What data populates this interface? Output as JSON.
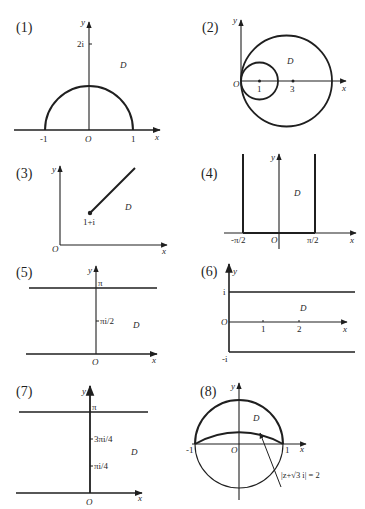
{
  "figure": {
    "ink_color": "#1f1f1f",
    "background": "#ffffff",
    "panels": [
      {
        "id": "1",
        "label": "(1)",
        "axis_x": "x",
        "axis_y": "y",
        "origin": "O",
        "region": "D",
        "ticks": {
          "neg_one": "-1",
          "one": "1",
          "two_i": "2i"
        },
        "description": "Upper half plane outside unit semicircle"
      },
      {
        "id": "2",
        "label": "(2)",
        "axis_x": "x",
        "axis_y": "y",
        "origin": "O",
        "region": "D",
        "ticks": {
          "one": "1",
          "three": "3"
        },
        "description": "Region between two internally tangent circles centered at 1 and 3"
      },
      {
        "id": "3",
        "label": "(3)",
        "axis_x": "x",
        "axis_y": "y",
        "origin": "O",
        "region": "D",
        "point": "1+i",
        "description": "Plane minus ray starting at 1+i"
      },
      {
        "id": "4",
        "label": "(4)",
        "axis_x": "x",
        "axis_y": "y",
        "origin": "O",
        "region": "D",
        "ticks": {
          "neg_half_pi": "-π/2",
          "half_pi": "π/2"
        },
        "description": "Half strip -π/2 < x < π/2, y > 0"
      },
      {
        "id": "5",
        "label": "(5)",
        "axis_x": "x",
        "axis_y": "y",
        "origin": "O",
        "region": "D",
        "ticks": {
          "pi": "π",
          "half_pi_i": "πi/2"
        },
        "description": "Horizontal strip 0 < y < π"
      },
      {
        "id": "6",
        "label": "(6)",
        "axis_x": "x",
        "axis_y": "y",
        "origin": "O",
        "region": "D",
        "ticks": {
          "i": "i",
          "neg_i": "-i",
          "one": "1",
          "two": "2"
        },
        "description": "Half strip x > 0, -1 < y < 1"
      },
      {
        "id": "7",
        "label": "(7)",
        "axis_x": "x",
        "axis_y": "y",
        "origin": "O",
        "region": "D",
        "ticks": {
          "pi": "π",
          "three_quarter_pi_i": "3πi/4",
          "quarter_pi_i": "πi/4"
        },
        "description": "Horizontal strip 0 < y < π"
      },
      {
        "id": "8",
        "label": "(8)",
        "axis_x": "x",
        "axis_y": "y",
        "origin": "O",
        "region": "D",
        "ticks": {
          "neg_one": "-1",
          "one": "1"
        },
        "annotation": "|z+√3 i| = 2",
        "description": "Lune between unit circle upper arc and circle |z+√3i|=2"
      }
    ]
  }
}
